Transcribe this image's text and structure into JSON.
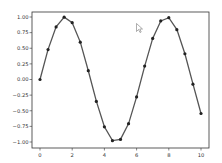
{
  "chart_data": {
    "type": "line",
    "title": "",
    "xlabel": "",
    "ylabel": "",
    "xlim": [
      -0.5,
      10.5
    ],
    "ylim": [
      -1.1,
      1.1
    ],
    "grid": false,
    "legend": null,
    "x_ticks": [
      "0",
      "2",
      "4",
      "6",
      "8",
      "10"
    ],
    "y_ticks": [
      "1.00",
      "0.75",
      "0.50",
      "0.25",
      "0.00",
      "−0.25",
      "−0.50",
      "−0.75",
      "−1.00"
    ],
    "series": [
      {
        "name": "sin(x)",
        "marker": "circle",
        "line_color": "#555555",
        "marker_color": "#222222",
        "x": [
          0,
          0.5,
          1.0,
          1.5,
          2.0,
          2.5,
          3.0,
          3.5,
          4.0,
          4.5,
          5.0,
          5.5,
          6.0,
          6.5,
          7.0,
          7.5,
          8.0,
          8.5,
          9.0,
          9.5,
          10.0
        ],
        "y": [
          0.0,
          0.479,
          0.841,
          0.997,
          0.909,
          0.598,
          0.141,
          -0.351,
          -0.757,
          -0.978,
          -0.959,
          -0.706,
          -0.279,
          0.215,
          0.657,
          0.938,
          0.989,
          0.798,
          0.412,
          -0.075,
          -0.544
        ]
      }
    ]
  },
  "overlay": {
    "cursor": "mouse-pointer-icon"
  }
}
